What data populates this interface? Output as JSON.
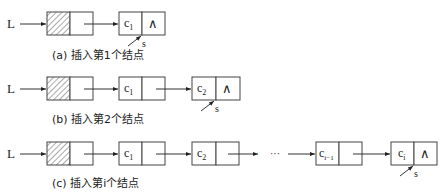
{
  "diagram": {
    "null_symbol": "∧",
    "head_pointer_label": "L",
    "pointer_label": "s",
    "ellipsis": "···",
    "colors": {
      "line": "#333333",
      "box_border": "#444444",
      "text": "#222222",
      "hatch": "#555555"
    },
    "panels": [
      {
        "id": "a",
        "caption": "(a) 插入第1个结点",
        "nodes": [
          {
            "data": "c",
            "sub": "1",
            "next": "∧",
            "pointer": "s"
          }
        ]
      },
      {
        "id": "b",
        "caption": "(b) 插入第2个结点",
        "nodes": [
          {
            "data": "c",
            "sub": "1",
            "next": ""
          },
          {
            "data": "c",
            "sub": "2",
            "next": "∧",
            "pointer": "s"
          }
        ]
      },
      {
        "id": "c",
        "caption": "(c) 插入第i个结点",
        "nodes": [
          {
            "data": "c",
            "sub": "1",
            "next": ""
          },
          {
            "data": "c",
            "sub": "2",
            "next": ""
          },
          {
            "data": "c",
            "sub": "i−1",
            "next": ""
          },
          {
            "data": "c",
            "sub": "i",
            "next": "∧",
            "pointer": "s"
          }
        ]
      }
    ]
  }
}
